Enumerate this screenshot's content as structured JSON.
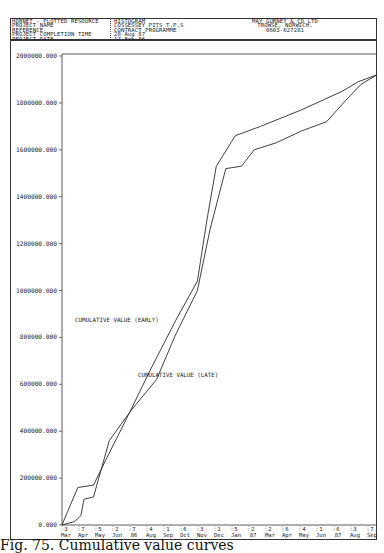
{
  "header": {
    "left_lines": [
      "HORNET - PLOTTED RESOURCE",
      "PROJECT NAME",
      "REFERENCE",
      "PROJECT COMPLETION TIME",
      "PROJECT DATE"
    ],
    "mid_lines": [
      "HISTOGRAM",
      "COSSESSEY PITS T.P.S",
      "CONTRACT PROGRAMME",
      "28 Aug 87",
      "17 Feb 86"
    ],
    "right_lines": [
      "MAY GURNEY & CO LTD",
      "TROWSE, NORWICH.",
      "0603-627281"
    ]
  },
  "caption": "Fig. 75. Cumulative value curves",
  "chart_data": {
    "type": "line",
    "xlabel": "",
    "ylabel": "",
    "ylim": [
      0,
      2000000
    ],
    "yticks": [
      "0.000",
      "200000.000",
      "400000.000",
      "600000.000",
      "800000.000",
      "1000000.000",
      "1200000.000",
      "1400000.000",
      "1600000.000",
      "1800000.000",
      "2000000.000"
    ],
    "x_ticks": [
      {
        "day": "3",
        "month": "Mar"
      },
      {
        "day": "7",
        "month": "Apr"
      },
      {
        "day": "5",
        "month": "May"
      },
      {
        "day": "2",
        "month": "Jun"
      },
      {
        "day": "7",
        "month": "86"
      },
      {
        "day": "4",
        "month": "Aug"
      },
      {
        "day": "1",
        "month": "Sep"
      },
      {
        "day": "6",
        "month": "Oct"
      },
      {
        "day": "3",
        "month": "Nov"
      },
      {
        "day": "1",
        "month": "Dec"
      },
      {
        "day": "5",
        "month": "Jan"
      },
      {
        "day": "2",
        "month": "87"
      },
      {
        "day": "2",
        "month": "Mar"
      },
      {
        "day": "6",
        "month": "Apr"
      },
      {
        "day": "4",
        "month": "May"
      },
      {
        "day": "1",
        "month": "Jun"
      },
      {
        "day": "6",
        "month": "87"
      },
      {
        "day": "3",
        "month": "Aug"
      },
      {
        "day": "7",
        "month": "Sep"
      }
    ],
    "grid": false,
    "legend_position": "inline annotations",
    "series": [
      {
        "name": "CUMULATIVE VALUE (EARLY)",
        "points": [
          [
            0,
            0
          ],
          [
            0.05,
            160000
          ],
          [
            0.1,
            170000
          ],
          [
            0.14,
            280000
          ],
          [
            0.2,
            440000
          ],
          [
            0.28,
            660000
          ],
          [
            0.36,
            870000
          ],
          [
            0.43,
            1040000
          ],
          [
            0.46,
            1300000
          ],
          [
            0.49,
            1530000
          ],
          [
            0.55,
            1660000
          ],
          [
            0.63,
            1700000
          ],
          [
            0.76,
            1770000
          ],
          [
            0.89,
            1850000
          ],
          [
            0.94,
            1890000
          ],
          [
            1.0,
            1920000
          ]
        ]
      },
      {
        "name": "CUMULATIVE VALUE (LATE)",
        "points": [
          [
            0,
            0
          ],
          [
            0.04,
            15000
          ],
          [
            0.06,
            40000
          ],
          [
            0.07,
            110000
          ],
          [
            0.1,
            120000
          ],
          [
            0.15,
            360000
          ],
          [
            0.22,
            490000
          ],
          [
            0.3,
            620000
          ],
          [
            0.36,
            810000
          ],
          [
            0.43,
            1000000
          ],
          [
            0.47,
            1260000
          ],
          [
            0.52,
            1520000
          ],
          [
            0.57,
            1530000
          ],
          [
            0.61,
            1600000
          ],
          [
            0.68,
            1630000
          ],
          [
            0.76,
            1680000
          ],
          [
            0.84,
            1720000
          ],
          [
            0.9,
            1810000
          ],
          [
            0.95,
            1880000
          ],
          [
            1.0,
            1920000
          ]
        ]
      }
    ],
    "annotations": [
      {
        "text": "CUMULATIVE VALUE (EARLY)",
        "series": 0
      },
      {
        "text": "CUMULATIVE VALUE (LATE)",
        "series": 1
      }
    ]
  }
}
